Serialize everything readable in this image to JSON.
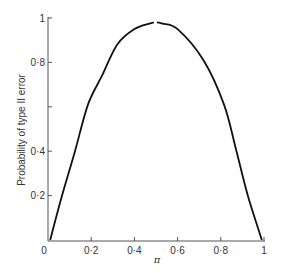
{
  "chart_data": {
    "type": "line",
    "title": "",
    "xlabel": "π",
    "ylabel": "Probability of type II error",
    "xlim": [
      0,
      1
    ],
    "ylim": [
      0,
      1
    ],
    "grid": false,
    "legend": null,
    "x_ticks": [
      {
        "value": 0,
        "label": "0"
      },
      {
        "value": 0.2,
        "label": "0·2"
      },
      {
        "value": 0.4,
        "label": "0·4"
      },
      {
        "value": 0.6,
        "label": "0·6"
      },
      {
        "value": 0.8,
        "label": "0·8"
      },
      {
        "value": 1,
        "label": "1"
      }
    ],
    "y_ticks": [
      {
        "value": 0.2,
        "label": "0·2"
      },
      {
        "value": 0.4,
        "label": "0·4"
      },
      {
        "value": 0.6,
        "label": ""
      },
      {
        "value": 0.8,
        "label": "0·8"
      },
      {
        "value": 1,
        "label": "1"
      }
    ],
    "series": [
      {
        "name": "Probability of type II error",
        "color": "#111111",
        "x": [
          0.01,
          0.065,
          0.125,
          0.185,
          0.25,
          0.32,
          0.4,
          0.47,
          0.5,
          0.53,
          0.6,
          0.72,
          0.815,
          0.87,
          0.925,
          0.99
        ],
        "y": [
          0.0,
          0.2,
          0.4,
          0.61,
          0.74,
          0.88,
          0.95,
          0.975,
          0.98,
          0.975,
          0.95,
          0.81,
          0.61,
          0.41,
          0.2,
          0.0
        ]
      }
    ],
    "annotations": [
      "small gap in curve near peak at π ≈ 0.5"
    ]
  }
}
